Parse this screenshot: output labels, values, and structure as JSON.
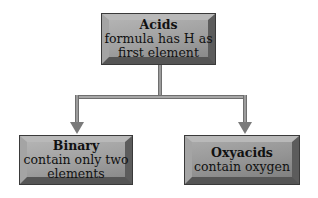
{
  "diagram": {
    "type": "tree",
    "root": {
      "title": "Acids",
      "line1": "formula has H as",
      "line2": "first element"
    },
    "children": [
      {
        "title": "Binary",
        "line1": "contain only two",
        "line2": "elements"
      },
      {
        "title": "Oxyacids",
        "line1": "contain oxygen",
        "line2": ""
      }
    ],
    "colors": {
      "box_fill": "#a0a0a0",
      "box_border": "#3a3a3a",
      "connector": "#6f6f6f",
      "text": "#111111"
    }
  }
}
